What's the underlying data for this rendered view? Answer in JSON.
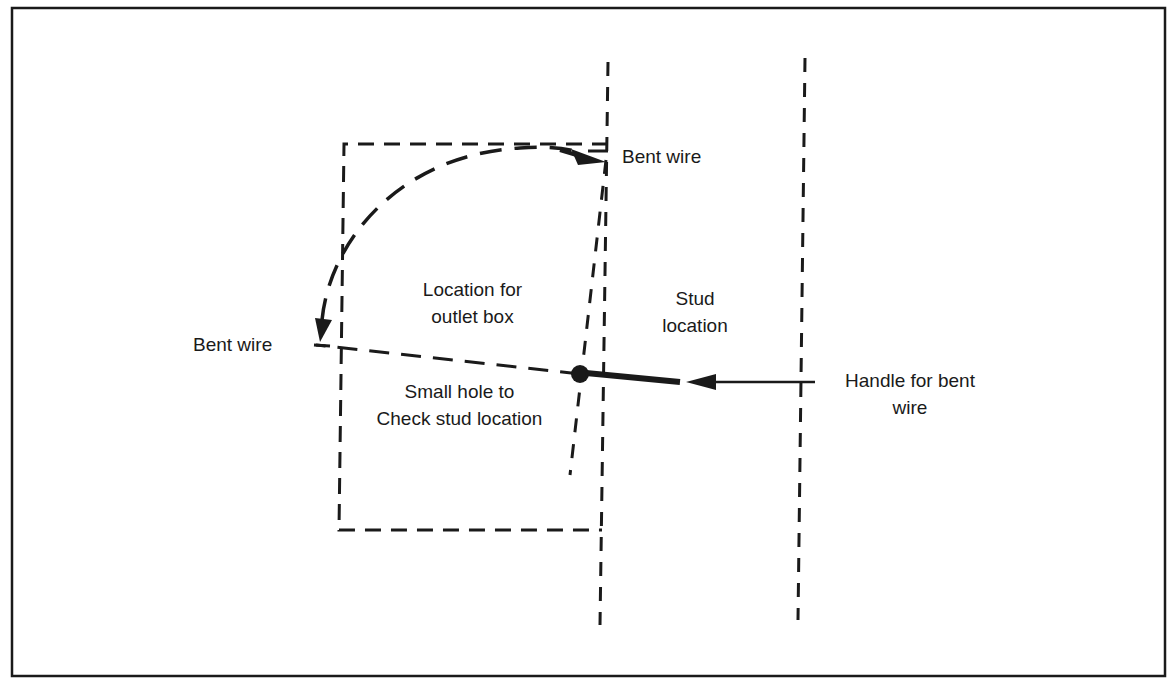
{
  "diagram": {
    "type": "technical-illustration",
    "colors": {
      "ink": "#1a1a1a",
      "background": "#ffffff"
    },
    "labels": {
      "bent_wire_top": "Bent wire",
      "bent_wire_left": "Bent wire",
      "outlet_box": {
        "line1": "Location for",
        "line2": "outlet box"
      },
      "stud": {
        "line1": "Stud",
        "line2": "location"
      },
      "small_hole": {
        "line1": "Small hole to",
        "line2": "Check stud location"
      },
      "handle": {
        "line1": "Handle for bent",
        "line2": "wire"
      }
    },
    "elements": [
      {
        "id": "frame",
        "kind": "rectangle",
        "style": "solid"
      },
      {
        "id": "outlet-box-outline",
        "kind": "rectangle",
        "style": "dashed"
      },
      {
        "id": "stud-edge-left",
        "kind": "line",
        "style": "dashed"
      },
      {
        "id": "stud-edge-right",
        "kind": "line",
        "style": "dashed"
      },
      {
        "id": "wire-arc",
        "kind": "curved-arrow",
        "style": "dashed"
      },
      {
        "id": "wire-swing-line",
        "kind": "line",
        "style": "dashed"
      },
      {
        "id": "wire-tilted-line",
        "kind": "line",
        "style": "dashed"
      },
      {
        "id": "small-hole",
        "kind": "dot"
      },
      {
        "id": "handle-wire",
        "kind": "thick-line"
      },
      {
        "id": "handle-arrow",
        "kind": "arrow"
      }
    ]
  }
}
